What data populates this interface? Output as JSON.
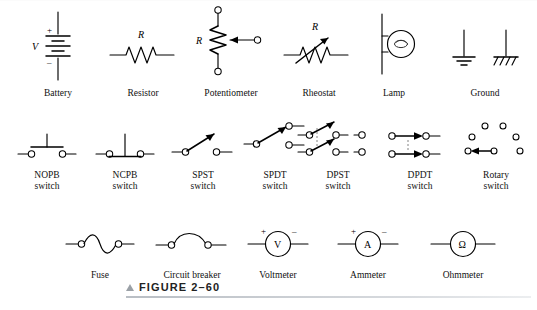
{
  "figure": {
    "caption_marker": "▲",
    "caption": "FIGURE 2–60"
  },
  "rows": [
    {
      "name": "components",
      "items": [
        {
          "id": "battery",
          "label": "Battery",
          "symbol": "battery-symbol",
          "annotations": {
            "value": "V",
            "plus": "+",
            "minus": "–"
          }
        },
        {
          "id": "resistor",
          "label": "Resistor",
          "symbol": "resistor-symbol",
          "annotations": {
            "value": "R"
          }
        },
        {
          "id": "potentiometer",
          "label": "Potentiometer",
          "symbol": "potentiometer-symbol",
          "annotations": {
            "value": "R"
          }
        },
        {
          "id": "rheostat",
          "label": "Rheostat",
          "symbol": "rheostat-symbol",
          "annotations": {
            "value": "R"
          }
        },
        {
          "id": "lamp",
          "label": "Lamp",
          "symbol": "lamp-symbol",
          "annotations": {}
        },
        {
          "id": "ground",
          "label": "Ground",
          "symbol": "ground-symbol",
          "annotations": {}
        }
      ]
    },
    {
      "name": "switches",
      "items": [
        {
          "id": "nopb",
          "label": "NOPB\nswitch",
          "symbol": "nopb-switch-symbol",
          "annotations": {}
        },
        {
          "id": "ncpb",
          "label": "NCPB\nswitch",
          "symbol": "ncpb-switch-symbol",
          "annotations": {}
        },
        {
          "id": "spst",
          "label": "SPST\nswitch",
          "symbol": "spst-switch-symbol",
          "annotations": {}
        },
        {
          "id": "spdt",
          "label": "SPDT\nswitch",
          "symbol": "spdt-switch-symbol",
          "annotations": {}
        },
        {
          "id": "dpst",
          "label": "DPST\nswitch",
          "symbol": "dpst-switch-symbol",
          "annotations": {}
        },
        {
          "id": "dpdt",
          "label": "DPDT\nswitch",
          "symbol": "dpdt-switch-symbol",
          "annotations": {}
        },
        {
          "id": "rotary",
          "label": "Rotary\nswitch",
          "symbol": "rotary-switch-symbol",
          "annotations": {}
        }
      ]
    },
    {
      "name": "protection-and-meters",
      "items": [
        {
          "id": "fuse",
          "label": "Fuse",
          "symbol": "fuse-symbol",
          "annotations": {}
        },
        {
          "id": "circuit-breaker",
          "label": "Circuit breaker",
          "symbol": "circuit-breaker-symbol",
          "annotations": {}
        },
        {
          "id": "voltmeter",
          "label": "Voltmeter",
          "symbol": "voltmeter-symbol",
          "annotations": {
            "letter": "V",
            "plus": "+",
            "minus": "–"
          }
        },
        {
          "id": "ammeter",
          "label": "Ammeter",
          "symbol": "ammeter-symbol",
          "annotations": {
            "letter": "A",
            "plus": "+",
            "minus": "–"
          }
        },
        {
          "id": "ohmmeter",
          "label": "Ohmmeter",
          "symbol": "ohmmeter-symbol",
          "annotations": {
            "letter": "Ω"
          }
        }
      ]
    }
  ],
  "colors": {
    "ink": "#000000",
    "rule": "#b9bec4",
    "caption_marker": "#9aa0a6"
  }
}
